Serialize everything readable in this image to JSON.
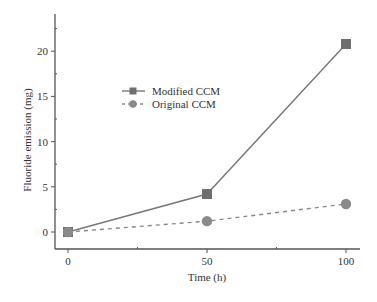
{
  "chart_data": {
    "type": "line",
    "title": "",
    "xlabel": "Time (h)",
    "ylabel": "Fluoride emission (mg)",
    "x": [
      0,
      50,
      100
    ],
    "xticks": [
      0,
      50,
      100
    ],
    "xtick_labels": [
      "0",
      "50",
      "100"
    ],
    "xminor": [
      25,
      75
    ],
    "yticks": [
      0,
      5,
      10,
      15,
      20
    ],
    "ytick_labels": [
      "0",
      "5",
      "10",
      "15",
      "20"
    ],
    "yminor": [
      2.5,
      7.5,
      12.5,
      17.5,
      22.5
    ],
    "xlim": [
      -5,
      105
    ],
    "ylim": [
      -1.9,
      24
    ],
    "grid": false,
    "legend_position": "upper-left-inside",
    "series": [
      {
        "name": "Modified CCM",
        "values": [
          0,
          4.2,
          20.8
        ],
        "marker": "square",
        "line_style": "solid",
        "color": "#777777"
      },
      {
        "name": "Original CCM",
        "values": [
          0,
          1.2,
          3.1
        ],
        "marker": "circle",
        "line_style": "dashed",
        "color": "#888888"
      }
    ]
  }
}
